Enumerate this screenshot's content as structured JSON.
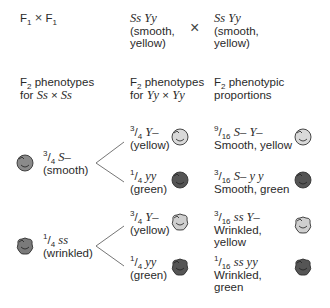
{
  "header": {
    "cross_label_f": "F",
    "cross_label_sub": "1",
    "cross_symbol": "×",
    "parent1": {
      "genotype": "Ss Yy",
      "phenotype_line1": "(smooth,",
      "phenotype_line2": "yellow)"
    },
    "parent2": {
      "genotype": "Ss Yy",
      "phenotype_line1": "(smooth,",
      "phenotype_line2": "yellow)"
    },
    "parent_cross_symbol": "×"
  },
  "columns": {
    "col1": {
      "line1_pre": "F",
      "line1_sub": "2",
      "line1_post": " phenotypes",
      "line2_pre": "for ",
      "line2_geno_a": "Ss",
      "line2_x": " × ",
      "line2_geno_b": "Ss"
    },
    "col2": {
      "line1_pre": "F",
      "line1_sub": "2",
      "line1_post": " phenotypes",
      "line2_pre": "for ",
      "line2_geno_a": "Yy",
      "line2_x": " × ",
      "line2_geno_b": "Yy"
    },
    "col3": {
      "line1_pre": "F",
      "line1_sub": "2",
      "line1_post": " phenotypic",
      "line2": "proportions"
    }
  },
  "smooth": {
    "num": "3",
    "den": "4",
    "geno": "S–",
    "label": "(smooth)",
    "yellow": {
      "num": "3",
      "den": "4",
      "geno": "Y–",
      "label": "(yellow)",
      "result": {
        "num": "9",
        "den": "16",
        "geno": "S– Y–",
        "label1": "Smooth, yellow"
      }
    },
    "green": {
      "num": "1",
      "den": "4",
      "geno": "yy",
      "label": "(green)",
      "result": {
        "num": "3",
        "den": "16",
        "geno": "S– y y",
        "label1": "Smooth, green"
      }
    }
  },
  "wrinkled": {
    "num": "1",
    "den": "4",
    "geno": "ss",
    "label": "(wrinkled)",
    "yellow": {
      "num": "3",
      "den": "4",
      "geno": "Y–",
      "label": "(yellow)",
      "result": {
        "num": "3",
        "den": "16",
        "geno": "ss Y–",
        "label1": "Wrinkled,",
        "label2": "yellow"
      }
    },
    "green": {
      "num": "1",
      "den": "4",
      "geno": "yy",
      "label": "(green)",
      "result": {
        "num": "1",
        "den": "16",
        "geno": "ss yy",
        "label1": "Wrinkled,",
        "label2": "green"
      }
    }
  },
  "colors": {
    "pea_yellow": "#d9d9d9",
    "pea_green": "#555555",
    "pea_mid": "#8a8a8a",
    "outline": "#333333",
    "branch_line": "#666666"
  }
}
